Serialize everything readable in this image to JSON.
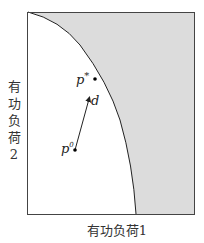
{
  "diagram": {
    "x_axis_label": "有功负荷1",
    "y_axis_label_chars": [
      "有",
      "功",
      "负",
      "荷",
      "2"
    ],
    "points": {
      "p_star": {
        "label_base": "p",
        "label_sup": "*"
      },
      "p_zero": {
        "label_base": "p",
        "label_sup": "0"
      },
      "direction": {
        "label": "d"
      }
    },
    "colors": {
      "feasible_region": "#ffffff",
      "infeasible_region": "#dcdcdc",
      "stroke": "#222222"
    }
  }
}
